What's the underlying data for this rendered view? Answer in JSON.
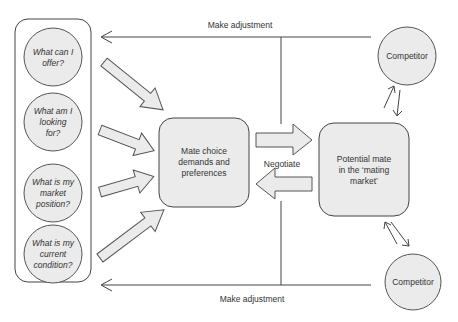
{
  "colors": {
    "fill": "#ebebeb",
    "stroke": "#555555",
    "line": "#444444",
    "text": "#333333",
    "background": "#ffffff"
  },
  "self_questions": [
    {
      "lines": [
        "What can I",
        "offer?"
      ]
    },
    {
      "lines": [
        "What am I",
        "looking",
        "for?"
      ]
    },
    {
      "lines": [
        "What is my",
        "market",
        "position?"
      ]
    },
    {
      "lines": [
        "What is my",
        "current",
        "condition?"
      ]
    }
  ],
  "mate_choice": {
    "lines": [
      "Mate choice",
      "demands and",
      "preferences"
    ]
  },
  "potential_mate": {
    "lines": [
      "Potential mate",
      "in the ‘mating",
      "market’"
    ]
  },
  "negotiate_label": "Negotiate",
  "competitors": [
    {
      "label": "Competitor"
    },
    {
      "label": "Competitor"
    }
  ],
  "feedback": {
    "top_label": "Make adjustment",
    "bottom_label": "Make adjustment"
  }
}
